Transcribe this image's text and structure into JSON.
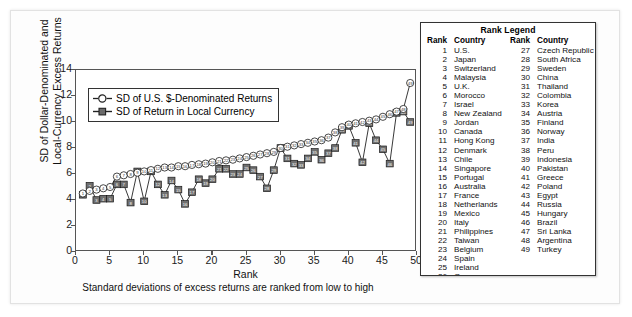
{
  "chart_data": {
    "type": "line",
    "title": "",
    "xlabel": "Rank",
    "xsublabel": "Standard deviations of excess returns are ranked from low to high",
    "ylabel": "SD of Dollar-Denominated and Local-Currency Excess Returns",
    "xlim": [
      0,
      50
    ],
    "ylim": [
      0,
      14
    ],
    "xticks": [
      0,
      5,
      10,
      15,
      20,
      25,
      30,
      35,
      40,
      45,
      50
    ],
    "yticks": [
      0,
      2,
      4,
      6,
      8,
      10,
      12,
      14
    ],
    "grid": false,
    "legend_position": "upper-left-inside",
    "x": [
      1,
      2,
      3,
      4,
      5,
      6,
      7,
      8,
      9,
      10,
      11,
      12,
      13,
      14,
      15,
      16,
      17,
      18,
      19,
      20,
      21,
      22,
      23,
      24,
      25,
      26,
      27,
      28,
      29,
      30,
      31,
      32,
      33,
      34,
      35,
      36,
      37,
      38,
      39,
      40,
      41,
      42,
      43,
      44,
      45,
      46,
      47,
      48,
      49
    ],
    "series": [
      {
        "name": "SD of U.S. $-Denominated Returns",
        "marker": "open-circle",
        "values": [
          4.5,
          4.7,
          4.8,
          4.9,
          5.0,
          5.8,
          5.9,
          6.0,
          6.1,
          6.2,
          6.3,
          6.4,
          6.5,
          6.5,
          6.6,
          6.6,
          6.7,
          6.75,
          6.8,
          6.9,
          7.0,
          7.05,
          7.1,
          7.2,
          7.3,
          7.4,
          7.5,
          7.6,
          7.7,
          8.0,
          8.1,
          8.2,
          8.3,
          8.4,
          8.5,
          8.6,
          8.8,
          9.2,
          9.6,
          9.8,
          9.9,
          10.0,
          10.1,
          10.2,
          10.4,
          10.6,
          10.8,
          11.0,
          13.0
        ]
      },
      {
        "name": "SD of Return in Local Currency",
        "marker": "filled-square",
        "values": [
          4.4,
          5.1,
          4.0,
          4.1,
          4.1,
          5.2,
          5.2,
          3.8,
          6.2,
          3.9,
          6.2,
          5.2,
          4.4,
          5.5,
          4.8,
          3.7,
          4.6,
          5.6,
          5.3,
          5.6,
          6.4,
          6.4,
          6.0,
          6.0,
          6.5,
          6.3,
          5.8,
          4.9,
          6.3,
          8.0,
          7.2,
          6.8,
          6.7,
          7.2,
          7.7,
          7.1,
          7.6,
          8.0,
          9.4,
          9.7,
          8.4,
          6.9,
          9.9,
          8.6,
          7.9,
          6.8,
          10.7,
          10.8,
          10.0
        ]
      }
    ]
  },
  "chart_legend": {
    "items": [
      {
        "label": "SD of U.S. $-Denominated Returns",
        "marker": "open-circle"
      },
      {
        "label": "SD of Return in Local Currency",
        "marker": "filled-square"
      }
    ]
  },
  "rank_legend": {
    "title": "Rank Legend",
    "headers": {
      "rank": "Rank",
      "country": "Country"
    },
    "left_column": [
      {
        "rank": "1",
        "country": "U.S."
      },
      {
        "rank": "2",
        "country": "Japan"
      },
      {
        "rank": "3",
        "country": "Switzerland"
      },
      {
        "rank": "4",
        "country": "Malaysia"
      },
      {
        "rank": "5",
        "country": "U.K."
      },
      {
        "rank": "6",
        "country": "Morocco"
      },
      {
        "rank": "7",
        "country": "Israel"
      },
      {
        "rank": "8",
        "country": "New Zealand"
      },
      {
        "rank": "9",
        "country": "Jordan"
      },
      {
        "rank": "10",
        "country": "Canada"
      },
      {
        "rank": "11",
        "country": "Hong Kong"
      },
      {
        "rank": "12",
        "country": "Denmark"
      },
      {
        "rank": "13",
        "country": "Chile"
      },
      {
        "rank": "14",
        "country": "Singapore"
      },
      {
        "rank": "15",
        "country": "Portugal"
      },
      {
        "rank": "16",
        "country": "Australia"
      },
      {
        "rank": "17",
        "country": "France"
      },
      {
        "rank": "18",
        "country": "Netherlands"
      },
      {
        "rank": "19",
        "country": "Mexico"
      },
      {
        "rank": "20",
        "country": "Italy"
      },
      {
        "rank": "21",
        "country": "Philippines"
      },
      {
        "rank": "22",
        "country": "Taiwan"
      },
      {
        "rank": "23",
        "country": "Belgium"
      },
      {
        "rank": "24",
        "country": "Spain"
      },
      {
        "rank": "25",
        "country": "Ireland"
      },
      {
        "rank": "26",
        "country": "Germany"
      }
    ],
    "right_column": [
      {
        "rank": "27",
        "country": "Czech Republic"
      },
      {
        "rank": "28",
        "country": "South Africa"
      },
      {
        "rank": "29",
        "country": "Sweden"
      },
      {
        "rank": "30",
        "country": "China"
      },
      {
        "rank": "31",
        "country": "Thailand"
      },
      {
        "rank": "32",
        "country": "Colombia"
      },
      {
        "rank": "33",
        "country": "Korea"
      },
      {
        "rank": "34",
        "country": "Austria"
      },
      {
        "rank": "35",
        "country": "Finland"
      },
      {
        "rank": "36",
        "country": "Norway"
      },
      {
        "rank": "37",
        "country": "India"
      },
      {
        "rank": "38",
        "country": "Peru"
      },
      {
        "rank": "39",
        "country": "Indonesia"
      },
      {
        "rank": "40",
        "country": "Pakistan"
      },
      {
        "rank": "41",
        "country": "Greece"
      },
      {
        "rank": "42",
        "country": "Poland"
      },
      {
        "rank": "43",
        "country": "Egypt"
      },
      {
        "rank": "44",
        "country": "Russia"
      },
      {
        "rank": "45",
        "country": "Hungary"
      },
      {
        "rank": "46",
        "country": "Brazil"
      },
      {
        "rank": "47",
        "country": "Sri Lanka"
      },
      {
        "rank": "48",
        "country": "Argentina"
      },
      {
        "rank": "49",
        "country": "Turkey"
      }
    ]
  },
  "colors": {
    "axis": "#555555",
    "line": "#222222",
    "marker_fill_local": "#6b6b6b",
    "marker_fill_usd": "#ffffff",
    "text": "#111111",
    "page_bg": "#ffffff"
  }
}
